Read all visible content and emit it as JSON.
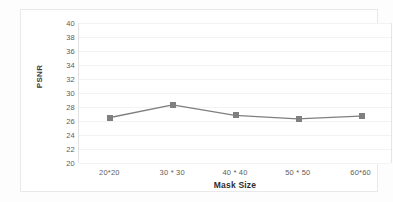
{
  "chart_data": {
    "type": "line",
    "title": "",
    "xlabel": "Mask Size",
    "ylabel": "PSNR",
    "categories": [
      "20*20",
      "30 * 30",
      "40 * 40",
      "50 * 50",
      "60*60"
    ],
    "values": [
      26.5,
      28.3,
      26.8,
      26.3,
      26.7
    ],
    "series": [
      {
        "name": "PSNR",
        "values": [
          26.5,
          28.3,
          26.8,
          26.3,
          26.7
        ]
      }
    ],
    "ylim": [
      20,
      40
    ],
    "ytick_step": 2,
    "yticks": [
      40,
      38,
      36,
      34,
      32,
      30,
      28,
      26,
      24,
      22,
      20
    ],
    "grid": true,
    "grid_axis": "y",
    "legend": "none",
    "marker": "square",
    "colors": {
      "series_line": "#7f7f7f",
      "marker": "#7f7f7f",
      "gridline": "#f3f3f3",
      "axis_text": "#5c5c5c",
      "title_text": "#2e2e2e",
      "plot_background": "#ffffff",
      "frame_border": "#e9e9e9"
    }
  }
}
